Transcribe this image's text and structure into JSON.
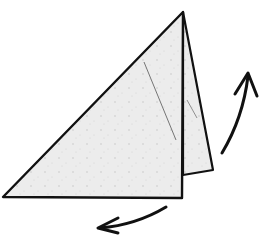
{
  "diagram": {
    "type": "origami-fold-step",
    "caption_fragment": "",
    "colors": {
      "paper": "#ececec",
      "paper_back": "#e6e6e6",
      "outline": "#111111",
      "crease": "#666666",
      "arrow": "#111111",
      "background": "#ffffff"
    },
    "shapes": {
      "front_triangle": {
        "points": [
          [
            183,
            12
          ],
          [
            3,
            197
          ],
          [
            182,
            198
          ]
        ]
      },
      "back_flap": {
        "points": [
          [
            183,
            12
          ],
          [
            213,
            170
          ],
          [
            183,
            175
          ]
        ]
      },
      "crease_line": {
        "from": [
          144,
          62
        ],
        "to": [
          176,
          140
        ]
      },
      "flap_crease": {
        "from": [
          187,
          100
        ],
        "to": [
          197,
          118
        ]
      }
    },
    "arrows": [
      {
        "name": "fold-up-arrow",
        "direction": "up-right",
        "from": [
          222,
          153
        ],
        "to": [
          248,
          75
        ]
      },
      {
        "name": "fold-down-arrow",
        "direction": "down-left",
        "from": [
          166,
          207
        ],
        "to": [
          98,
          228
        ]
      }
    ]
  }
}
